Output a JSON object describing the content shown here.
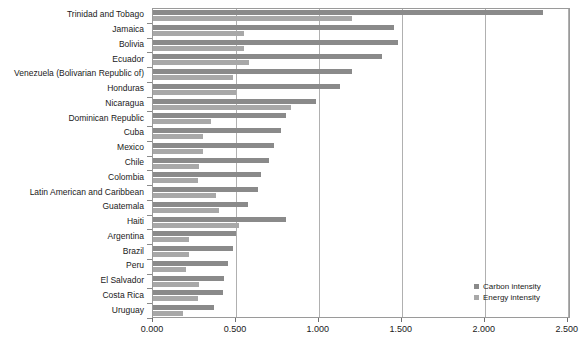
{
  "chart_data": {
    "type": "bar",
    "orientation": "horizontal",
    "title": "",
    "subtitle": "",
    "xlabel": "",
    "ylabel": "",
    "xlim": [
      0.0,
      2.52
    ],
    "grid": true,
    "legend_position": "bottom-right",
    "tick_labels": [
      "0.000",
      "0.500",
      "1.000",
      "1.500",
      "2.000",
      "2.500"
    ],
    "tick_values": [
      0.0,
      0.5,
      1.0,
      1.5,
      2.0,
      2.5
    ],
    "categories": [
      "Trinidad and Tobago",
      "Jamaica",
      "Bolivia",
      "Ecuador",
      "Venezuela (Bolivarian Republic of)",
      "Honduras",
      "Nicaragua",
      "Dominican Republic",
      "Cuba",
      "Mexico",
      "Chile",
      "Colombia",
      "Latin American and Caribbean",
      "Guatemala",
      "Haiti",
      "Argentina",
      "Brazil",
      "Peru",
      "El Salvador",
      "Costa Rica",
      "Uruguay"
    ],
    "series": [
      {
        "name": "Carbon intensity",
        "color": "#8a8a8a",
        "values": [
          2.35,
          1.45,
          1.48,
          1.38,
          1.2,
          1.13,
          0.98,
          0.8,
          0.77,
          0.73,
          0.7,
          0.65,
          0.63,
          0.57,
          0.8,
          0.5,
          0.48,
          0.45,
          0.43,
          0.42,
          0.37
        ]
      },
      {
        "name": "Energy intensity",
        "color": "#a8a8a8",
        "values": [
          1.2,
          0.55,
          0.55,
          0.58,
          0.48,
          0.5,
          0.83,
          0.35,
          0.3,
          0.3,
          0.28,
          0.27,
          0.38,
          0.4,
          0.52,
          0.22,
          0.22,
          0.2,
          0.28,
          0.27,
          0.18
        ]
      }
    ]
  },
  "legend": {
    "items": [
      {
        "label": "Carbon intensity"
      },
      {
        "label": "Energy intensity"
      }
    ]
  },
  "colors": {
    "carbon": "#8a8a8a",
    "energy": "#a8a8a8",
    "grid": "#b0b0b0",
    "frame": "#9a9a9a",
    "text": "#1a1a1a"
  }
}
